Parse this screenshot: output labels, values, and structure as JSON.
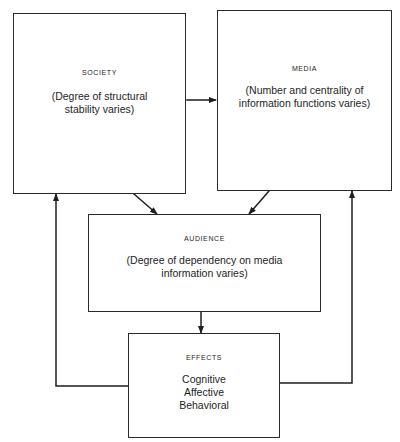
{
  "diagram": {
    "nodes": {
      "society": {
        "title": "SOCIETY",
        "description": "(Degree of structural stability varies)"
      },
      "media": {
        "title": "MEDIA",
        "description": "(Number and centrality of information functions varies)"
      },
      "audience": {
        "title": "AUDIENCE",
        "description": "(Degree of dependency on media information varies)"
      },
      "effects": {
        "title": "EFFECTS",
        "items": [
          "Cognitive",
          "Affective",
          "Behavioral"
        ]
      }
    },
    "edges": [
      {
        "from": "society",
        "to": "media",
        "direction": "bidirectional"
      },
      {
        "from": "society",
        "to": "audience",
        "direction": "bidirectional"
      },
      {
        "from": "media",
        "to": "audience",
        "direction": "bidirectional"
      },
      {
        "from": "audience",
        "to": "effects",
        "direction": "forward"
      },
      {
        "from": "effects",
        "to": "society",
        "direction": "forward"
      },
      {
        "from": "effects",
        "to": "media",
        "direction": "forward"
      }
    ]
  }
}
